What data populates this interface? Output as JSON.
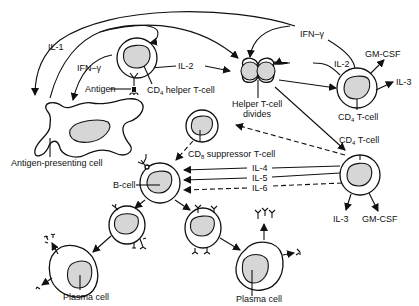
{
  "diagram": {
    "type": "immune-response-flow",
    "labels": {
      "il1": "IL-1",
      "ifn_left": "IFN–γ",
      "ifn_top": "IFN–γ",
      "il2_left": "IL-2",
      "il2_right": "IL-2",
      "antigen": "Antigen",
      "cd4_helper": "CD",
      "cd4_helper_sub": "4",
      "cd4_helper_rest": " helper T-cell",
      "helper_divides_1": "Helper T-cell",
      "helper_divides_2": "divides",
      "gmcsf_top": "GM-CSF",
      "il3_top": "IL-3",
      "cd4_tcell_top": "CD",
      "cd4_tcell_top_sub": "4",
      "cd4_tcell_top_rest": " T-cell",
      "cd4_tcell_mid": "CD",
      "cd4_tcell_mid_sub": "4",
      "cd4_tcell_mid_rest": " T-cell",
      "apc": "Antigen-presenting cell",
      "cd8": "CD",
      "cd8_sub": "8",
      "cd8_rest": " suppressor T-cell",
      "bcell": "B-cell",
      "il4": "IL-4",
      "il5": "IL-5",
      "il6": "IL-6",
      "il3_bottom": "IL-3",
      "gmcsf_bottom": "GM-CSF",
      "plasma_left": "Plasma cell",
      "plasma_right": "Plasma cell"
    }
  }
}
